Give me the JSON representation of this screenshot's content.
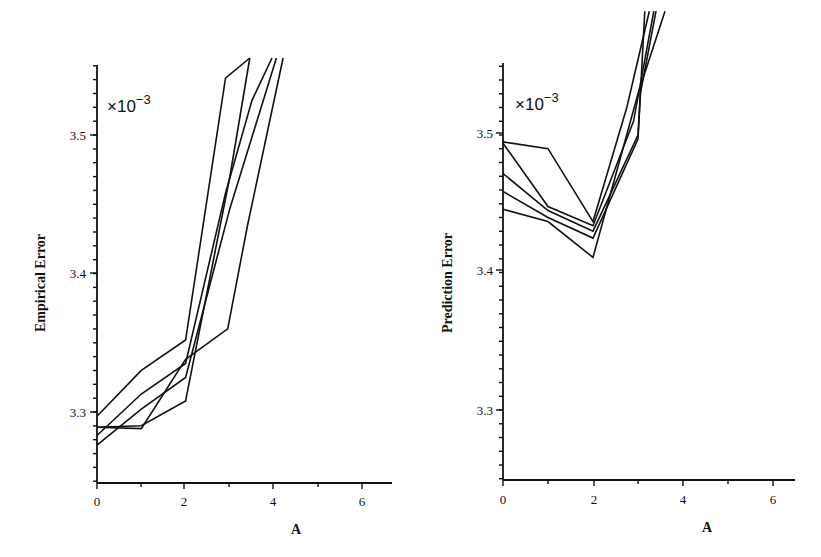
{
  "chart_data": [
    {
      "type": "line",
      "title": "",
      "xlabel": "A",
      "ylabel": "Empirical Error",
      "scale_annotation": "×10",
      "scale_exponent": "−3",
      "xlim": [
        0,
        6.6
      ],
      "ylim": [
        3.25,
        3.555
      ],
      "xticks": [
        0,
        2,
        4,
        6
      ],
      "xtick_labels": [
        "0",
        "2",
        "4",
        "6"
      ],
      "yticks": [
        3.3,
        3.4,
        3.5
      ],
      "ytick_labels": [
        "3.3",
        "3.4",
        "3.5"
      ],
      "grid": false,
      "legend": null,
      "series": [
        {
          "name": "run 1",
          "x": [
            0,
            1,
            2,
            2.9,
            3.45
          ],
          "y": [
            3.297,
            3.33,
            3.352,
            3.541,
            3.556
          ]
        },
        {
          "name": "run 2",
          "x": [
            0,
            1,
            2,
            3,
            3.45
          ],
          "y": [
            3.289,
            3.29,
            3.308,
            3.47,
            3.556
          ]
        },
        {
          "name": "run 3",
          "x": [
            0,
            1,
            2,
            2.9,
            3.5,
            3.95
          ],
          "y": [
            3.283,
            3.313,
            3.335,
            3.458,
            3.525,
            3.556
          ]
        },
        {
          "name": "run 4",
          "x": [
            0,
            1,
            2,
            3,
            4.05
          ],
          "y": [
            3.276,
            3.302,
            3.325,
            3.447,
            3.556
          ]
        },
        {
          "name": "run 5",
          "x": [
            0,
            1,
            2,
            2.95,
            3.4,
            4.2
          ],
          "y": [
            3.289,
            3.288,
            3.338,
            3.36,
            3.435,
            3.556
          ]
        }
      ]
    },
    {
      "type": "line",
      "title": "",
      "xlabel": "A",
      "ylabel": "Prediction Error",
      "scale_annotation": "×10",
      "scale_exponent": "−3",
      "xlim": [
        0,
        6.5
      ],
      "ylim": [
        3.25,
        3.552
      ],
      "xticks": [
        0,
        2,
        4,
        6
      ],
      "xtick_labels": [
        "0",
        "2",
        "4",
        "6"
      ],
      "yticks": [
        3.3,
        3.4,
        3.5
      ],
      "ytick_labels": [
        "3.3",
        "3.4",
        "3.5"
      ],
      "grid": false,
      "legend": null,
      "series": [
        {
          "name": "run 1",
          "x": [
            0,
            1,
            2,
            2.75,
            3.25
          ],
          "y": [
            3.495,
            3.49,
            3.437,
            3.52,
            3.59
          ]
        },
        {
          "name": "run 2",
          "x": [
            0,
            1,
            2,
            2.9,
            3.35
          ],
          "y": [
            3.494,
            3.448,
            3.434,
            3.51,
            3.59
          ]
        },
        {
          "name": "run 3",
          "x": [
            0,
            1,
            2,
            3,
            3.05,
            3.4
          ],
          "y": [
            3.472,
            3.445,
            3.43,
            3.5,
            3.53,
            3.59
          ]
        },
        {
          "name": "run 4",
          "x": [
            0,
            1,
            2,
            3,
            3.15
          ],
          "y": [
            3.459,
            3.44,
            3.425,
            3.497,
            3.59
          ]
        },
        {
          "name": "run 5",
          "x": [
            0,
            1,
            2,
            3,
            3.6
          ],
          "y": [
            3.446,
            3.437,
            3.411,
            3.53,
            3.59
          ]
        }
      ]
    }
  ],
  "panels": {
    "left": {
      "ylabel": "Empirical Error",
      "xlabel": "A",
      "scale_base": "×10",
      "scale_exp": "−3",
      "yticks": [
        "3.5",
        "3.4",
        "3.3"
      ],
      "xticks": [
        "0",
        "2",
        "4",
        "6"
      ]
    },
    "right": {
      "ylabel": "Prediction Error",
      "xlabel": "A",
      "scale_base": "×10",
      "scale_exp": "−3",
      "yticks": [
        "3.5",
        "3.4",
        "3.3"
      ],
      "xticks": [
        "0",
        "2",
        "4",
        "6"
      ]
    }
  }
}
